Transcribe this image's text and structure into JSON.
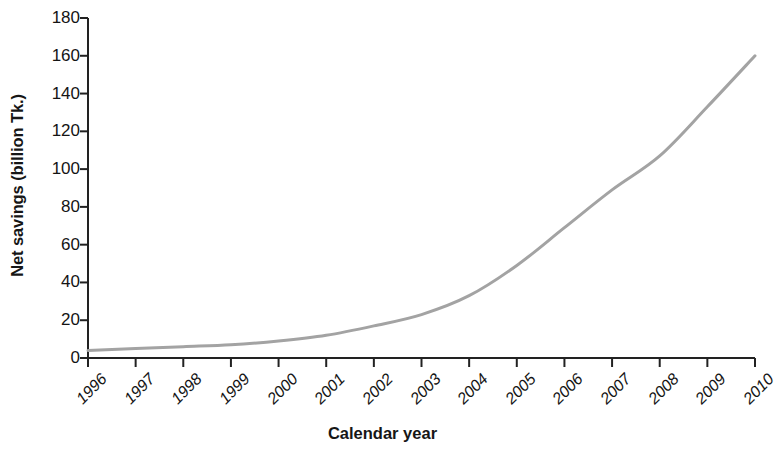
{
  "chart_data": {
    "type": "line",
    "title": "",
    "subtitle": "",
    "xlabel": "Calendar year",
    "ylabel": "Net savings (billion Tk.)",
    "x": [
      1996,
      1997,
      1998,
      1999,
      2000,
      2001,
      2002,
      2003,
      2004,
      2005,
      2006,
      2007,
      2008,
      2009,
      2010
    ],
    "categories": [
      "1996",
      "1997",
      "1998",
      "1999",
      "2000",
      "2001",
      "2002",
      "2003",
      "2004",
      "2005",
      "2006",
      "2007",
      "2008",
      "2009",
      "2010"
    ],
    "values": [
      4,
      5,
      6,
      7,
      9,
      12,
      17,
      23,
      33,
      49,
      69,
      89,
      107,
      133,
      160
    ],
    "series": [
      {
        "name": "Net savings",
        "values": [
          4,
          5,
          6,
          7,
          9,
          12,
          17,
          23,
          33,
          49,
          69,
          89,
          107,
          133,
          160
        ],
        "color": "#a3a3a3",
        "line_width": 3
      }
    ],
    "xlim": [
      1996,
      2010
    ],
    "ylim": [
      0,
      180
    ],
    "ytick_values": [
      0,
      20,
      40,
      60,
      80,
      100,
      120,
      140,
      160,
      180
    ],
    "ytick_labels": [
      "0",
      "20",
      "40",
      "60",
      "80",
      "100",
      "120",
      "140",
      "160",
      "180"
    ],
    "ytick_step": 20,
    "xtick_label_rotation_deg": -45,
    "grid": false,
    "legend": false,
    "legend_position": "none",
    "axis_color": "#222222",
    "background_color": "#ffffff",
    "annotations": []
  }
}
